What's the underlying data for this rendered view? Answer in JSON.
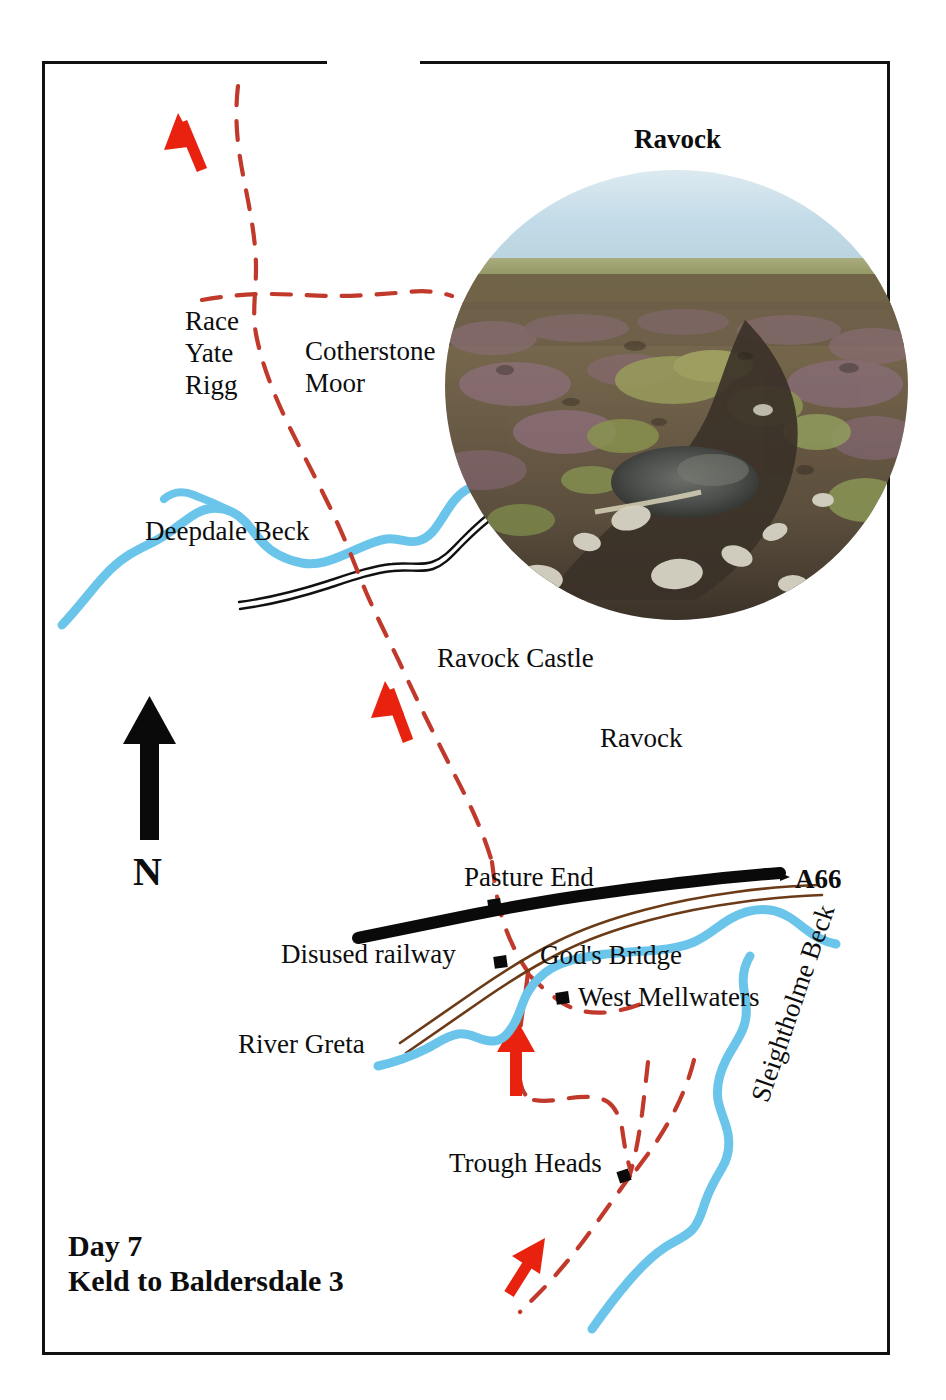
{
  "figure": {
    "type": "hiking-route-map",
    "caption_line1": "Day 7",
    "caption_line2": "Keld to Baldersdale 3",
    "photo_title": "Ravock",
    "photo_description": "Open moorland with purple heather, tussock grass and a boggy peat stream with pale stones under a pale blue sky",
    "north_label": "N"
  },
  "labels": {
    "race_yate_rigg": "Race\nYate\nRigg",
    "cotherstone_moor": "Cotherstone\nMoor",
    "deepdale_beck": "Deepdale Beck",
    "ravock_castle": "Ravock Castle",
    "ravock": "Ravock",
    "pasture_end": "Pasture End",
    "a66": "A66",
    "disused_railway": "Disused railway",
    "gods_bridge": "God's Bridge",
    "west_mellwaters": "West Mellwaters",
    "river_greta": "River Greta",
    "trough_heads": "Trough Heads",
    "sleightholme_beck": "Sleightholme Beck"
  },
  "legend_semantics": {
    "route_path": "red dashed line — walking route / footpath",
    "direction_arrows": "solid red arrows — direction of travel (northward)",
    "water": "light blue line — beck / river",
    "main_road": "thick black line — A66 trunk road",
    "railway": "brown double line — disused railway",
    "track_wall": "black double line — track or wall",
    "building": "small black square — building / farm"
  },
  "colors": {
    "route_red": "#C0392B",
    "arrow_red": "#E8220F",
    "water_blue": "#6BC5EA",
    "road_black": "#0A0A0A",
    "railway_brown": "#6B3A16",
    "frame_black": "#111111",
    "sky": "#C9DEE8",
    "heather": "#7A6055",
    "grass": "#8D9456"
  },
  "features": {
    "arrow_count": 4,
    "building_markers": 4,
    "becks": [
      "Deepdale Beck",
      "River Greta",
      "Sleightholme Beck"
    ],
    "roads": [
      "A66"
    ],
    "places": [
      "Race Yate Rigg",
      "Cotherstone Moor",
      "Ravock Castle",
      "Ravock",
      "Pasture End",
      "God's Bridge",
      "West Mellwaters",
      "Trough Heads"
    ]
  }
}
